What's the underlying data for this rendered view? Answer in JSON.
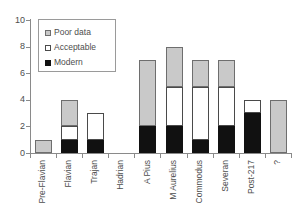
{
  "chart_data": {
    "type": "bar",
    "stacked": true,
    "title": "",
    "subtitle": "",
    "xlabel": "",
    "ylabel": "",
    "ylim": [
      0,
      10
    ],
    "ytick_labels": [
      "0",
      "2",
      "4",
      "6",
      "8",
      "10"
    ],
    "ytick_values": [
      0,
      2,
      4,
      6,
      8,
      10
    ],
    "grid": false,
    "legend_position": "upper-left-inside",
    "categories": [
      "Pre-Flavian",
      "Flavian",
      "Trajan",
      "Hadrian",
      "A Pius",
      "M Aurelius",
      "Commodus",
      "Severan",
      "Post-217",
      "?"
    ],
    "series": [
      {
        "name": "Modern",
        "color": "#111111",
        "values": [
          0,
          1,
          1,
          0,
          2,
          2,
          1,
          2,
          3,
          0
        ]
      },
      {
        "name": "Acceptable",
        "color": "#ffffff",
        "values": [
          0,
          1,
          2,
          0,
          0,
          3,
          4,
          3,
          1,
          0
        ]
      },
      {
        "name": "Poor data",
        "color": "#c9c9c9",
        "values": [
          1,
          2,
          0,
          0,
          5,
          3,
          2,
          2,
          0,
          4
        ]
      }
    ],
    "totals": [
      1,
      4,
      3,
      0,
      7,
      8,
      7,
      7,
      4,
      4
    ]
  },
  "legend": {
    "items": [
      {
        "label": "Poor data",
        "swatch": "poor"
      },
      {
        "label": "Acceptable",
        "swatch": "acceptable"
      },
      {
        "label": "Modern",
        "swatch": "modern"
      }
    ]
  }
}
